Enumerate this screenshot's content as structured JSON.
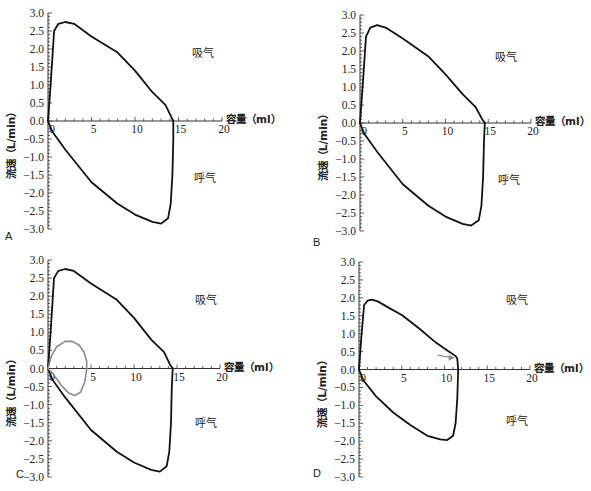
{
  "chart_data": [
    {
      "type": "line",
      "panel": "A",
      "xlabel": "容量（ml）",
      "ylabel": "流速（L/min）",
      "xlim": [
        0,
        20
      ],
      "ylim": [
        -3.0,
        3.0
      ],
      "xticks": [
        "0",
        "5",
        "10",
        "15",
        "20"
      ],
      "yticks": [
        "3.0",
        "2.5",
        "2.0",
        "1.5",
        "1.0",
        "0.5",
        "0.0",
        "-0.5",
        "-1.0",
        "-1.5",
        "-2.0",
        "-2.5",
        "-3.0"
      ],
      "annotations": [
        "吸气",
        "呼气"
      ],
      "series": [
        {
          "name": "inspiration",
          "color": "#111111",
          "x": [
            0,
            0.3,
            0.7,
            1.2,
            2,
            3,
            5,
            8,
            10,
            12,
            13.5,
            14.2,
            14.4
          ],
          "y": [
            0,
            1.0,
            2.5,
            2.7,
            2.75,
            2.7,
            2.35,
            1.9,
            1.4,
            0.8,
            0.45,
            0.1,
            0
          ]
        },
        {
          "name": "expiration",
          "color": "#111111",
          "x": [
            0,
            0.5,
            2,
            5,
            8,
            10,
            12,
            13,
            13.8,
            14.1,
            14.3,
            14.4,
            14.4
          ],
          "y": [
            0,
            -0.3,
            -0.8,
            -1.7,
            -2.3,
            -2.6,
            -2.8,
            -2.85,
            -2.7,
            -2.3,
            -1.5,
            -0.5,
            0
          ]
        }
      ]
    },
    {
      "type": "line",
      "panel": "B",
      "xlabel": "容量（ml）",
      "ylabel": "流速（L/min）",
      "xlim": [
        0,
        20
      ],
      "ylim": [
        -3.0,
        3.0
      ],
      "xticks": [
        "0",
        "5",
        "10",
        "15",
        "20"
      ],
      "yticks": [
        "3.0",
        "2.5",
        "2.0",
        "1.5",
        "1.0",
        "0.5",
        "0.0",
        "-0.5",
        "-1.0",
        "-1.5",
        "-2.0",
        "-2.5",
        "-3.0"
      ],
      "annotations": [
        "吸气",
        "呼气"
      ],
      "series": [
        {
          "name": "inspiration",
          "color": "#111111",
          "x": [
            0,
            0.3,
            0.7,
            1.2,
            2,
            3,
            5,
            8,
            10,
            12,
            13.5,
            14.3,
            14.6
          ],
          "y": [
            0,
            1.0,
            2.4,
            2.65,
            2.72,
            2.65,
            2.35,
            1.85,
            1.35,
            0.8,
            0.45,
            0.1,
            0
          ]
        },
        {
          "name": "expiration",
          "color": "#111111",
          "x": [
            0,
            0.5,
            2,
            5,
            8,
            10,
            12,
            13,
            13.9,
            14.2,
            14.4,
            14.5,
            14.6
          ],
          "y": [
            0,
            -0.3,
            -0.8,
            -1.7,
            -2.3,
            -2.6,
            -2.8,
            -2.85,
            -2.7,
            -2.3,
            -1.5,
            -0.5,
            0
          ]
        }
      ]
    },
    {
      "type": "line",
      "panel": "C",
      "xlabel": "容量（ml）",
      "ylabel": "流速（L/min）",
      "xlim": [
        0,
        20
      ],
      "ylim": [
        -3.0,
        3.0
      ],
      "xticks": [
        "0",
        "5",
        "10",
        "15",
        "20"
      ],
      "yticks": [
        "3.0",
        "2.5",
        "2.0",
        "1.5",
        "1.0",
        "0.5",
        "0.0",
        "-0.5",
        "-1.0",
        "-1.5",
        "-2.0",
        "-2.5",
        "-3.0"
      ],
      "annotations": [
        "吸气",
        "呼气"
      ],
      "series": [
        {
          "name": "inspiration",
          "color": "#111111",
          "x": [
            0,
            0.3,
            0.7,
            1.2,
            2,
            3,
            5,
            8,
            10,
            12,
            13.5,
            14.2,
            14.5
          ],
          "y": [
            0,
            1.0,
            2.5,
            2.7,
            2.75,
            2.7,
            2.35,
            1.9,
            1.4,
            0.8,
            0.45,
            0.1,
            0
          ]
        },
        {
          "name": "expiration",
          "color": "#111111",
          "x": [
            0,
            0.5,
            2,
            5,
            8,
            10,
            12,
            13,
            13.8,
            14.1,
            14.3,
            14.4,
            14.5
          ],
          "y": [
            0,
            -0.3,
            -0.8,
            -1.7,
            -2.3,
            -2.6,
            -2.8,
            -2.85,
            -2.7,
            -2.3,
            -1.5,
            -0.5,
            0
          ]
        },
        {
          "name": "small-loop-inspiration",
          "color": "#8a8a8a",
          "x": [
            0,
            0.4,
            1,
            2,
            2.8,
            3.6,
            4.2,
            4.5,
            4.5
          ],
          "y": [
            0,
            0.35,
            0.6,
            0.75,
            0.75,
            0.65,
            0.45,
            0.2,
            0
          ]
        },
        {
          "name": "small-loop-expiration",
          "color": "#8a8a8a",
          "x": [
            0,
            0.6,
            1.5,
            2.4,
            3.1,
            3.8,
            4.3,
            4.5
          ],
          "y": [
            0,
            -0.15,
            -0.45,
            -0.68,
            -0.75,
            -0.65,
            -0.35,
            0
          ]
        }
      ]
    },
    {
      "type": "line",
      "panel": "D",
      "xlabel": "容量（ml）",
      "ylabel": "流速（L/min）",
      "xlim": [
        0,
        20
      ],
      "ylim": [
        -3.0,
        3.0
      ],
      "xticks": [
        "0",
        "5",
        "10",
        "15",
        "20"
      ],
      "yticks": [
        "3.0",
        "2.5",
        "2.0",
        "1.5",
        "1.0",
        "0.5",
        "0.0",
        "-0.5",
        "-1.0",
        "-1.5",
        "-2.0",
        "-2.5",
        "-3.0"
      ],
      "annotations": [
        "吸气",
        "呼气"
      ],
      "arrow": {
        "color": "#8a8a8a",
        "from": [
          9.2,
          0.4
        ],
        "to": [
          11.2,
          0.33
        ]
      },
      "series": [
        {
          "name": "inspiration",
          "color": "#111111",
          "x": [
            0,
            0.3,
            0.6,
            1,
            1.5,
            2.2,
            3.5,
            5,
            7,
            9,
            10.5,
            11.3,
            11.5,
            11.6
          ],
          "y": [
            0,
            1.0,
            1.8,
            1.92,
            1.95,
            1.9,
            1.72,
            1.52,
            1.15,
            0.75,
            0.5,
            0.38,
            0.3,
            0
          ]
        },
        {
          "name": "expiration",
          "color": "#111111",
          "x": [
            0,
            0.5,
            2,
            4,
            6,
            8,
            9.5,
            10.3,
            11,
            11.3,
            11.5,
            11.6
          ],
          "y": [
            0,
            -0.3,
            -0.75,
            -1.2,
            -1.55,
            -1.85,
            -1.95,
            -1.97,
            -1.85,
            -1.5,
            -0.8,
            0
          ]
        }
      ]
    }
  ],
  "panels": [
    {
      "label": "A",
      "inspiration_label": "吸气",
      "expiration_label": "呼气"
    },
    {
      "label": "B",
      "inspiration_label": "吸气",
      "expiration_label": "呼气"
    },
    {
      "label": "C",
      "inspiration_label": "吸气",
      "expiration_label": "呼气"
    },
    {
      "label": "D",
      "inspiration_label": "吸气",
      "expiration_label": "呼气"
    }
  ]
}
